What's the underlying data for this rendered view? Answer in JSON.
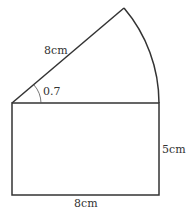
{
  "diagram": {
    "type": "composite-shape",
    "shapes": {
      "rectangle": {
        "width_label": "8cm",
        "height_label": "5cm"
      },
      "sector": {
        "radius_label": "8cm",
        "angle_label": "0.7"
      }
    },
    "labels": {
      "sector_radius": "8cm",
      "angle": "0.7",
      "rect_height": "5cm",
      "rect_width": "8cm"
    },
    "colors": {
      "stroke": "#333333",
      "background": "#ffffff"
    }
  }
}
